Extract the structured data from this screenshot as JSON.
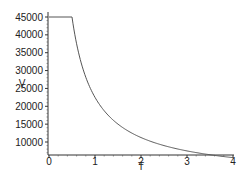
{
  "chart_data": {
    "type": "line",
    "title": "",
    "xlabel": "T",
    "ylabel": "V",
    "xlim": [
      0,
      4
    ],
    "ylim": [
      6360,
      45000
    ],
    "grid": false,
    "legend": null,
    "x_ticks": [
      0,
      1,
      2,
      3,
      4
    ],
    "x_tick_labels": [
      "0",
      "1",
      "2",
      "3",
      "4"
    ],
    "y_ticks": [
      10000,
      15000,
      20000,
      25000,
      30000,
      35000,
      40000,
      45000
    ],
    "y_tick_labels": [
      "10000",
      "15000",
      "20000",
      "25000",
      "30000",
      "35000",
      "40000",
      "45000"
    ],
    "series": [
      {
        "name": "V",
        "color": "#555555",
        "x": [
          0,
          0.5,
          0.6,
          0.7,
          0.8,
          0.9,
          1.0,
          1.25,
          1.5,
          1.75,
          2.0,
          2.5,
          3.0,
          3.5,
          4.0
        ],
        "values": [
          45000,
          45000,
          37500,
          32143,
          28125,
          25000,
          22500,
          18000,
          15000,
          12857,
          11250,
          9000,
          7500,
          6429,
          5625
        ]
      }
    ]
  }
}
